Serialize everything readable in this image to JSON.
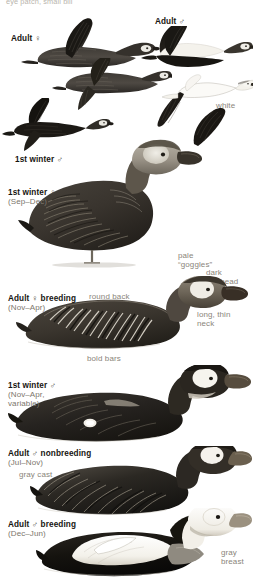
{
  "plate": {
    "species_note_cut_off": "eye patch, small bill",
    "background_color": "#ffffff",
    "caption_color": "#16140f",
    "annotation_color": "#8a857a",
    "width": 253,
    "height": 587
  },
  "captions": [
    {
      "id": "adult-female-flight",
      "label": "Adult",
      "symbol": "♀",
      "date": ""
    },
    {
      "id": "adult-male-flight",
      "label": "Adult",
      "symbol": "♂",
      "date": ""
    },
    {
      "id": "first-winter-male-flight",
      "label": "1st winter",
      "symbol": "♂",
      "date": ""
    },
    {
      "id": "first-winter-female-standing",
      "label": "1st winter",
      "symbol": "♀",
      "date": "(Sep–Dec)"
    },
    {
      "id": "adult-female-breeding",
      "label": "Adult",
      "symbol": "♀",
      "suffix": "breeding",
      "date": "(Nov–Apr)"
    },
    {
      "id": "first-winter-male-swimming",
      "label": "1st winter",
      "symbol": "♂",
      "date": "(Nov–Apr,\nvariable)"
    },
    {
      "id": "adult-male-nonbreeding",
      "label": "Adult",
      "symbol": "♂",
      "suffix": "nonbreeding",
      "date": "(Jul–Nov)"
    },
    {
      "id": "adult-male-breeding",
      "label": "Adult",
      "symbol": "♂",
      "suffix": "breeding",
      "date": "(Dec–Jun)"
    }
  ],
  "annotations": [
    {
      "id": "white",
      "text": "white"
    },
    {
      "id": "pale-goggles",
      "text": "pale\n“goggles”"
    },
    {
      "id": "dark-forehead",
      "text": "dark\nforehead"
    },
    {
      "id": "round-back",
      "text": "round back"
    },
    {
      "id": "long-thin-neck",
      "text": "long, thin\nneck"
    },
    {
      "id": "bold-bars",
      "text": "bold bars"
    },
    {
      "id": "gray-cast",
      "text": "gray cast"
    },
    {
      "id": "gray-breast",
      "text": "gray\nbreast"
    }
  ]
}
